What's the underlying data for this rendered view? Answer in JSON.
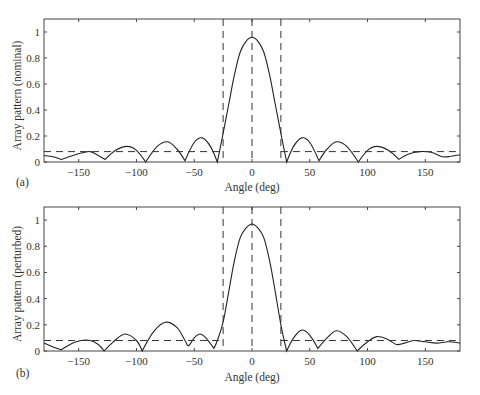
{
  "chart_data": [
    {
      "type": "line",
      "panel_label": "(a)",
      "title": "",
      "xlabel": "Angle (deg)",
      "ylabel": "Array pattern (nominal)",
      "xlim": [
        -180,
        180
      ],
      "ylim": [
        0,
        1.1
      ],
      "xticks": [
        -150,
        -100,
        -50,
        0,
        50,
        100,
        150
      ],
      "xtick_labels": [
        "−150",
        "−100",
        "−50",
        "0",
        "50",
        "100",
        "150"
      ],
      "yticks": [
        0,
        0.2,
        0.4,
        0.6,
        0.8,
        1
      ],
      "ytick_labels": [
        "0",
        "0.2",
        "0.4",
        "0.6",
        "0.8",
        "1"
      ],
      "grid": false,
      "series": [
        {
          "name": "pattern",
          "style": "solid",
          "x": [
            -180,
            -172,
            -165,
            -155,
            -145,
            -140,
            -135,
            -127,
            -118,
            -108,
            -100,
            -92,
            -82,
            -73,
            -65,
            -58,
            -50,
            -43,
            -36,
            -30,
            -25,
            -20,
            -15,
            -10,
            -5,
            0,
            5,
            10,
            15,
            20,
            25,
            30,
            36,
            43,
            50,
            58,
            65,
            73,
            82,
            92,
            100,
            108,
            118,
            127,
            135,
            145,
            155,
            165,
            172,
            180
          ],
          "y": [
            0.05,
            0.04,
            0.02,
            0.05,
            0.075,
            0.08,
            0.06,
            0.02,
            0.09,
            0.12,
            0.09,
            0.0,
            0.12,
            0.155,
            0.1,
            0.01,
            0.15,
            0.185,
            0.12,
            0.0,
            0.22,
            0.45,
            0.68,
            0.85,
            0.93,
            0.96,
            0.93,
            0.85,
            0.68,
            0.45,
            0.22,
            0.0,
            0.12,
            0.185,
            0.15,
            0.01,
            0.1,
            0.155,
            0.12,
            0.0,
            0.09,
            0.12,
            0.09,
            0.02,
            0.06,
            0.08,
            0.075,
            0.04,
            0.045,
            0.055
          ]
        },
        {
          "name": "sidelobe-level",
          "style": "dashed",
          "segments": [
            {
              "x": [
                -180,
                -25
              ],
              "y": [
                0.08,
                0.08
              ]
            },
            {
              "x": [
                25,
                180
              ],
              "y": [
                0.08,
                0.08
              ]
            }
          ]
        },
        {
          "name": "mainlobe-bounds",
          "style": "dashed",
          "vertical_lines_x": [
            -25,
            0,
            25
          ]
        }
      ]
    },
    {
      "type": "line",
      "panel_label": "(b)",
      "title": "",
      "xlabel": "Angle (deg)",
      "ylabel": "Array pattern (perturbed)",
      "xlim": [
        -180,
        180
      ],
      "ylim": [
        0,
        1.1
      ],
      "xticks": [
        -150,
        -100,
        -50,
        0,
        50,
        100,
        150
      ],
      "xtick_labels": [
        "−150",
        "−100",
        "−50",
        "0",
        "50",
        "100",
        "150"
      ],
      "yticks": [
        0,
        0.2,
        0.4,
        0.6,
        0.8,
        1
      ],
      "ytick_labels": [
        "0",
        "0.2",
        "0.4",
        "0.6",
        "0.8",
        "1"
      ],
      "grid": false,
      "series": [
        {
          "name": "pattern",
          "style": "solid",
          "x": [
            -180,
            -172,
            -165,
            -155,
            -148,
            -140,
            -133,
            -128,
            -120,
            -110,
            -100,
            -95,
            -85,
            -75,
            -65,
            -58,
            -55,
            -50,
            -45,
            -40,
            -33,
            -30,
            -25,
            -20,
            -15,
            -10,
            -5,
            0,
            5,
            10,
            15,
            20,
            25,
            30,
            36,
            43,
            50,
            57,
            65,
            73,
            82,
            91,
            100,
            108,
            117,
            125,
            132,
            140,
            150,
            160,
            170,
            180
          ],
          "y": [
            0.06,
            0.03,
            0.01,
            0.06,
            0.08,
            0.08,
            0.05,
            0.0,
            0.07,
            0.13,
            0.08,
            0.0,
            0.15,
            0.22,
            0.18,
            0.08,
            0.04,
            0.1,
            0.13,
            0.1,
            0.02,
            0.08,
            0.22,
            0.46,
            0.7,
            0.87,
            0.94,
            0.97,
            0.94,
            0.87,
            0.7,
            0.46,
            0.2,
            0.0,
            0.1,
            0.16,
            0.12,
            0.02,
            0.1,
            0.155,
            0.11,
            0.0,
            0.07,
            0.11,
            0.09,
            0.05,
            0.06,
            0.08,
            0.07,
            0.06,
            0.07,
            0.06
          ]
        },
        {
          "name": "sidelobe-level",
          "style": "dashed",
          "segments": [
            {
              "x": [
                -180,
                -25
              ],
              "y": [
                0.08,
                0.08
              ]
            },
            {
              "x": [
                25,
                180
              ],
              "y": [
                0.08,
                0.08
              ]
            }
          ]
        },
        {
          "name": "mainlobe-bounds",
          "style": "dashed",
          "vertical_lines_x": [
            -25,
            0,
            25
          ]
        }
      ]
    }
  ]
}
